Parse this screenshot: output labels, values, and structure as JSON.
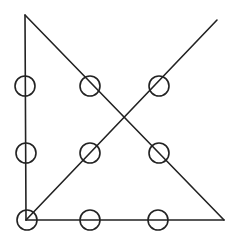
{
  "diagram": {
    "type": "nine-dots-puzzle-solution",
    "canvas": {
      "width": 235,
      "height": 242,
      "background": "#ffffff"
    },
    "stroke_color": "#222222",
    "dots": [
      {
        "row": 0,
        "col": 0,
        "cx": 25,
        "cy": 86,
        "r": 10
      },
      {
        "row": 0,
        "col": 1,
        "cx": 90,
        "cy": 86,
        "r": 10
      },
      {
        "row": 0,
        "col": 2,
        "cx": 159,
        "cy": 86,
        "r": 10
      },
      {
        "row": 1,
        "col": 0,
        "cx": 26,
        "cy": 153,
        "r": 10
      },
      {
        "row": 1,
        "col": 1,
        "cx": 90,
        "cy": 153,
        "r": 10
      },
      {
        "row": 1,
        "col": 2,
        "cx": 159,
        "cy": 153,
        "r": 10
      },
      {
        "row": 2,
        "col": 0,
        "cx": 27,
        "cy": 220,
        "r": 10
      },
      {
        "row": 2,
        "col": 1,
        "cx": 90,
        "cy": 220,
        "r": 10
      },
      {
        "row": 2,
        "col": 2,
        "cx": 158,
        "cy": 220,
        "r": 10
      }
    ],
    "lines": [
      {
        "name": "vertical-line",
        "x1": 25,
        "y1": 15,
        "x2": 26,
        "y2": 220
      },
      {
        "name": "bottom-line",
        "x1": 26,
        "y1": 220,
        "x2": 224,
        "y2": 220
      },
      {
        "name": "descending-diagonal",
        "x1": 25,
        "y1": 15,
        "x2": 224,
        "y2": 220
      },
      {
        "name": "ascending-diagonal",
        "x1": 26,
        "y1": 220,
        "x2": 217,
        "y2": 20
      }
    ]
  }
}
